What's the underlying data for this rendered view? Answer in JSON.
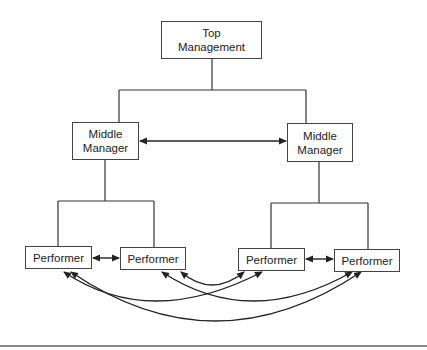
{
  "diagram": {
    "type": "organizational communication flow",
    "colors": {
      "line": "#333333",
      "box_border": "#444444",
      "text": "#222222",
      "rule": "#888888"
    },
    "nodes": {
      "top": {
        "line1": "Top",
        "line2": "Management"
      },
      "middle_left": {
        "line1": "Middle",
        "line2": "Manager"
      },
      "middle_right": {
        "line1": "Middle",
        "line2": "Manager"
      },
      "performer_1": {
        "label": "Performer"
      },
      "performer_2": {
        "label": "Performer"
      },
      "performer_3": {
        "label": "Performer"
      },
      "performer_4": {
        "label": "Performer"
      }
    },
    "hierarchy_edges": [
      [
        "top",
        "middle_left"
      ],
      [
        "top",
        "middle_right"
      ],
      [
        "middle_left",
        "performer_1"
      ],
      [
        "middle_left",
        "performer_2"
      ],
      [
        "middle_right",
        "performer_3"
      ],
      [
        "middle_right",
        "performer_4"
      ]
    ],
    "lateral_edges": [
      {
        "from": "middle_left",
        "to": "middle_right",
        "style": "double-arrow straight"
      },
      {
        "from": "performer_1",
        "to": "performer_2",
        "style": "double-arrow straight"
      },
      {
        "from": "performer_3",
        "to": "performer_4",
        "style": "double-arrow straight"
      },
      {
        "from": "performer_2",
        "to": "performer_3",
        "style": "double-arrow curved"
      },
      {
        "from": "performer_1",
        "to": "performer_3",
        "style": "double-arrow curved"
      },
      {
        "from": "performer_2",
        "to": "performer_4",
        "style": "double-arrow curved"
      },
      {
        "from": "performer_1",
        "to": "performer_4",
        "style": "double-arrow curved"
      }
    ]
  }
}
